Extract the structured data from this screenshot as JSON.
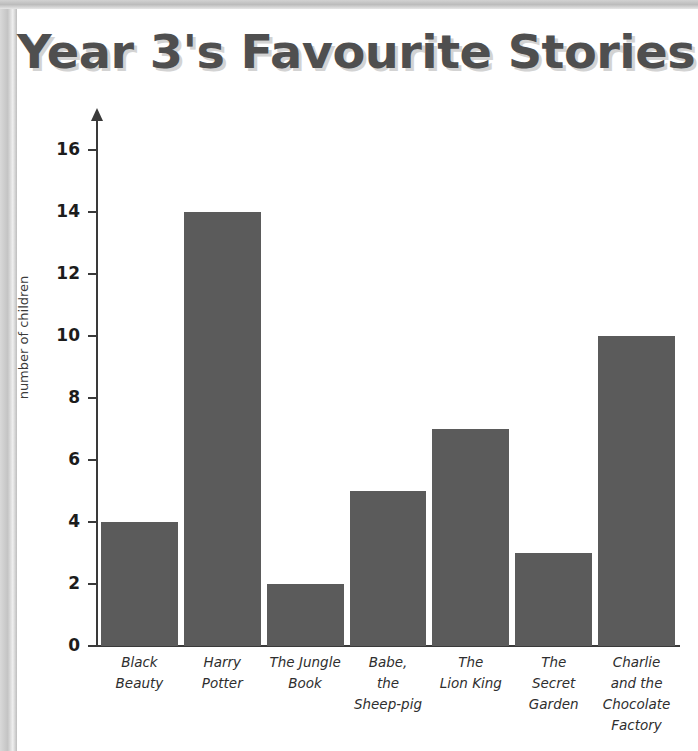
{
  "document": {
    "title_text": "Year 3's Favourite Stories",
    "title_color": "#4f4f4f",
    "title_shadow_color": "#d3d3d3",
    "background_color": "#ffffff",
    "scan_edge_color": "#c4c4c4"
  },
  "chart_data": {
    "type": "bar",
    "title": "Year 3's Favourite Stories",
    "xlabel": "",
    "ylabel": "number of children",
    "categories": [
      "Black Beauty",
      "Harry Potter",
      "The Jungle Book",
      "Babe, the Sheep-pig",
      "The Lion King",
      "The Secret Garden",
      "Charlie and the Chocolate Factory"
    ],
    "category_label_lines": [
      [
        "Black",
        "Beauty"
      ],
      [
        "Harry",
        "Potter"
      ],
      [
        "The Jungle",
        "Book"
      ],
      [
        "Babe,",
        "the",
        "Sheep-pig"
      ],
      [
        "The",
        "Lion King"
      ],
      [
        "The",
        "Secret",
        "Garden"
      ],
      [
        "Charlie",
        "and the",
        "Chocolate",
        "Factory"
      ]
    ],
    "values": [
      4,
      14,
      2,
      5,
      7,
      3,
      10
    ],
    "ylim": [
      0,
      17
    ],
    "ytick_labels": [
      "0",
      "2",
      "4",
      "6",
      "8",
      "10",
      "12",
      "14",
      "16"
    ],
    "ytick_values": [
      0,
      2,
      4,
      6,
      8,
      10,
      12,
      14,
      16
    ],
    "grid": false,
    "legend": "none",
    "bar_color": "#5b5b5b",
    "axis_color": "#3a3a3a"
  }
}
